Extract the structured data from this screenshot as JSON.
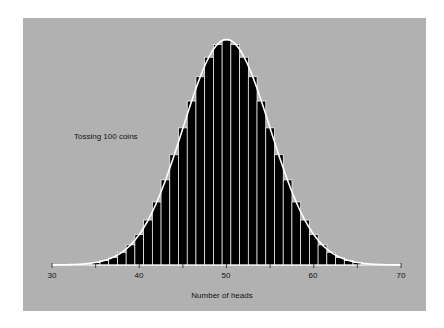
{
  "chart_data": {
    "type": "bar",
    "title": "",
    "annotation": "Tossing 100 coins",
    "xlabel": "Number of heads",
    "ylabel": "",
    "xlim": [
      30,
      70
    ],
    "x_ticks_labeled": [
      30,
      40,
      50,
      60,
      70
    ],
    "x_ticks_minor": [
      35,
      45,
      55,
      65
    ],
    "grid": false,
    "legend": null,
    "categories": [
      35,
      36,
      37,
      38,
      39,
      40,
      41,
      42,
      43,
      44,
      45,
      46,
      47,
      48,
      49,
      50,
      51,
      52,
      53,
      54,
      55,
      56,
      57,
      58,
      59,
      60,
      61,
      62,
      63,
      64,
      65
    ],
    "values": [
      0.0009,
      0.0016,
      0.0027,
      0.0045,
      0.0071,
      0.0108,
      0.0159,
      0.0223,
      0.0301,
      0.039,
      0.0485,
      0.058,
      0.0666,
      0.0735,
      0.078,
      0.0796,
      0.078,
      0.0735,
      0.0666,
      0.058,
      0.0485,
      0.039,
      0.0301,
      0.0223,
      0.0159,
      0.0108,
      0.0071,
      0.0045,
      0.0027,
      0.0016,
      0.0009
    ],
    "overlay": {
      "type": "line",
      "name": "normal approximation",
      "mean": 50,
      "sd": 5
    },
    "colors": {
      "background": "#b1b1b1",
      "bars": "#000000",
      "bar_separators": "#ffffff",
      "curve": "#ffffff",
      "text": "#111111"
    }
  },
  "labels": {
    "annotation": "Tossing 100 coins",
    "xlabel": "Number of heads",
    "ticks": [
      "30",
      "40",
      "50",
      "60",
      "70"
    ]
  }
}
